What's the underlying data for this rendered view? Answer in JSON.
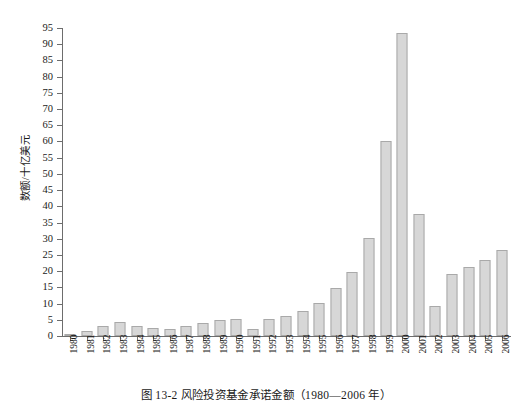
{
  "caption": "图 13-2   风险投资基金承诺金额（1980—2006 年）",
  "axes": {
    "y_label": "数额/十亿美元",
    "y_ticks": [
      "0",
      "5",
      "10",
      "15",
      "20",
      "25",
      "30",
      "35",
      "40",
      "45",
      "50",
      "55",
      "60",
      "65",
      "70",
      "75",
      "80",
      "85",
      "90",
      "95"
    ]
  },
  "colors": {
    "bar_fill": "#d7d7d7",
    "bar_border": "#a9a9a9",
    "axis": "#6d6d6d",
    "text": "#1a1a1a",
    "background": "#ffffff"
  },
  "chart_data": {
    "type": "bar",
    "title": "图 13-2   风险投资基金承诺金额（1980—2006 年）",
    "xlabel": "",
    "ylabel": "数额/十亿美元",
    "ylim": [
      0,
      95
    ],
    "ytick_step": 5,
    "grid": false,
    "legend": "none",
    "categories": [
      "1980",
      "1981",
      "1982",
      "1983",
      "1984",
      "1985",
      "1986",
      "1987",
      "1988",
      "1989",
      "1990",
      "1991",
      "1992",
      "1993",
      "1994",
      "1995",
      "1996",
      "1997",
      "1998",
      "1999",
      "2000",
      "2001",
      "2002",
      "2003",
      "2004",
      "2005",
      "2006"
    ],
    "values": [
      0.6,
      1.4,
      3.1,
      4.2,
      3.0,
      2.6,
      2.3,
      3.2,
      4.0,
      4.8,
      5.1,
      2.2,
      5.3,
      6.3,
      7.7,
      10.2,
      14.8,
      19.8,
      30.3,
      60.3,
      93.5,
      37.7,
      9.3,
      19.1,
      21.2,
      23.3,
      26.5
    ]
  }
}
